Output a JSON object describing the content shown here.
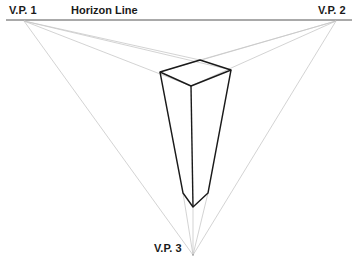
{
  "labels": {
    "vp1": "V.P. 1",
    "vp2": "V.P. 2",
    "vp3": "V.P. 3",
    "horizon": "Horizon Line"
  },
  "colors": {
    "horizon": "#555555",
    "guide": "#c8c8c8",
    "edge": "#1a1a1a"
  }
}
